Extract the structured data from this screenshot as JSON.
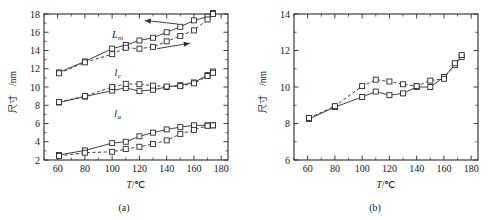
{
  "figure": {
    "panels": [
      {
        "id": "a",
        "caption": "(a)"
      },
      {
        "id": "b",
        "caption": "(b)"
      }
    ]
  },
  "chart_data": [
    {
      "type": "line",
      "panel": "a",
      "caption": "(a)",
      "title": "",
      "xlabel": "T/℃",
      "xlabel_symbol": "T",
      "xlabel_unit": "/℃",
      "ylabel": "尺寸/nm",
      "ylabel_cjk": "尺寸",
      "ylabel_unit": "/nm",
      "xlim": [
        50,
        185
      ],
      "ylim": [
        2,
        18
      ],
      "xticks": [
        60,
        80,
        100,
        120,
        140,
        160,
        180
      ],
      "yticks": [
        2,
        4,
        6,
        8,
        10,
        12,
        14,
        16,
        18
      ],
      "xticklabels": [
        "60",
        "80",
        "100",
        "120",
        "140",
        "160",
        "180"
      ],
      "yticklabels": [
        "2",
        "4",
        "6",
        "8",
        "10",
        "12",
        "14",
        "16",
        "18"
      ],
      "grid": false,
      "legend": "none",
      "annotations": [
        {
          "name": "heating-arrow",
          "text": "",
          "direction": "left",
          "x1": 148,
          "y1": 16.9,
          "x2": 124,
          "y2": 17.3
        },
        {
          "name": "cooling-arrow",
          "text": "",
          "direction": "right",
          "x1": 133,
          "y1": 14.2,
          "x2": 157,
          "y2": 14.8
        }
      ],
      "curve_labels": [
        {
          "name": "Lm",
          "symbol": "L",
          "sub": "m",
          "x": 104,
          "y": 15.4
        },
        {
          "name": "lc",
          "symbol": "l",
          "sub": "c",
          "x": 104,
          "y": 11.2
        },
        {
          "name": "la",
          "symbol": "l",
          "sub": "a",
          "x": 104,
          "y": 6.7
        }
      ],
      "series": [
        {
          "name": "L_m heating (solid)",
          "style": "solid",
          "x": [
            61,
            80,
            100,
            110,
            120,
            130,
            140,
            150,
            160,
            170,
            174
          ],
          "values": [
            11.6,
            12.8,
            14.2,
            14.6,
            15.1,
            15.4,
            16.0,
            16.6,
            17.3,
            17.7,
            18.1
          ]
        },
        {
          "name": "L_m cooling (dashed)",
          "style": "dashed",
          "x": [
            61,
            80,
            100,
            110,
            120,
            130,
            140,
            150,
            160,
            170,
            174
          ],
          "values": [
            11.5,
            12.7,
            13.6,
            14.3,
            14.2,
            14.4,
            15.0,
            15.6,
            16.2,
            17.4,
            18.0
          ]
        },
        {
          "name": "l_c heating (solid)",
          "style": "solid",
          "x": [
            61,
            80,
            100,
            110,
            120,
            130,
            140,
            150,
            160,
            170,
            174
          ],
          "values": [
            8.3,
            8.95,
            9.6,
            9.9,
            9.55,
            9.7,
            10.0,
            10.2,
            10.5,
            11.3,
            11.7
          ]
        },
        {
          "name": "l_c cooling (dashed)",
          "style": "dashed",
          "x": [
            61,
            80,
            100,
            110,
            120,
            130,
            140,
            150,
            160,
            170,
            174
          ],
          "values": [
            8.35,
            9.0,
            10.0,
            10.35,
            10.3,
            10.15,
            10.05,
            10.1,
            10.4,
            11.2,
            11.55
          ]
        },
        {
          "name": "l_a heating (solid)",
          "style": "solid",
          "x": [
            61,
            80,
            100,
            110,
            120,
            130,
            140,
            150,
            160,
            170,
            174
          ],
          "values": [
            2.55,
            3.05,
            3.85,
            4.0,
            4.6,
            5.0,
            5.35,
            5.6,
            5.8,
            5.8,
            5.8
          ]
        },
        {
          "name": "l_a cooling (dashed)",
          "style": "dashed",
          "x": [
            61,
            80,
            100,
            110,
            120,
            130,
            140,
            150,
            160,
            170,
            174
          ],
          "values": [
            2.45,
            2.8,
            2.9,
            3.2,
            3.45,
            3.75,
            4.15,
            4.85,
            5.3,
            5.75,
            5.8
          ]
        }
      ]
    },
    {
      "type": "line",
      "panel": "b",
      "caption": "(b)",
      "title": "",
      "xlabel": "T/℃",
      "xlabel_symbol": "T",
      "xlabel_unit": "/℃",
      "ylabel": "尺寸/nm",
      "ylabel_cjk": "尺寸",
      "ylabel_unit": "/nm",
      "xlim": [
        50,
        185
      ],
      "ylim": [
        6,
        14
      ],
      "xticks": [
        60,
        80,
        100,
        120,
        140,
        160,
        180
      ],
      "yticks": [
        6,
        8,
        10,
        12,
        14
      ],
      "xticklabels": [
        "60",
        "80",
        "100",
        "120",
        "140",
        "160",
        "180"
      ],
      "yticklabels": [
        "6",
        "8",
        "10",
        "12",
        "14"
      ],
      "grid": false,
      "legend": "none",
      "annotations": [],
      "curve_labels": [],
      "series": [
        {
          "name": "heating (solid)",
          "style": "solid",
          "x": [
            61,
            80,
            100,
            110,
            120,
            130,
            140,
            150,
            160,
            168,
            173
          ],
          "values": [
            8.25,
            8.9,
            9.45,
            9.75,
            9.55,
            9.65,
            10.0,
            10.0,
            10.55,
            11.2,
            11.65
          ]
        },
        {
          "name": "cooling (dashed)",
          "style": "dashed",
          "x": [
            61,
            80,
            100,
            110,
            120,
            130,
            140,
            150,
            160,
            168,
            173
          ],
          "values": [
            8.3,
            8.95,
            10.05,
            10.4,
            10.3,
            10.15,
            10.05,
            10.35,
            10.45,
            11.3,
            11.75
          ]
        }
      ]
    }
  ]
}
